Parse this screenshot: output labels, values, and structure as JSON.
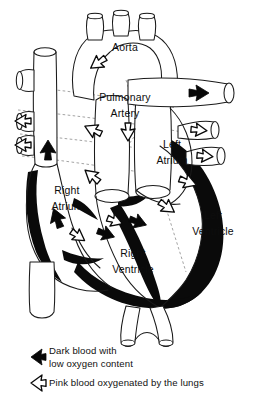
{
  "figure": {
    "width": 254,
    "height": 404
  },
  "labels": {
    "aorta": "Aorta",
    "pulmonary_artery_line1": "Pulmonary",
    "pulmonary_artery_line2": "Artery",
    "left_atrium_line1": "Left",
    "left_atrium_line2": "Atrium",
    "right_atrium_line1": "Right",
    "right_atrium_line2": "Atrium",
    "left_ventricle_line1": "Left",
    "left_ventricle_line2": "Ventricle",
    "right_ventricle_line1": "Right",
    "right_ventricle_line2": "Ventricle"
  },
  "legend": {
    "dark": {
      "line1": "Dark blood with",
      "line2": "low oxygen content",
      "marker": "dark-arrow-icon",
      "color": "#080808"
    },
    "light": {
      "line1": "Pink blood oxygenated by the lungs",
      "marker": "light-arrow-icon",
      "color": "#ffffff"
    }
  },
  "colors": {
    "ink": "#1a1a1a",
    "dark_blood": "#080808",
    "light_blood": "#ffffff",
    "dashed_guide": "#8c8c8c",
    "background": "#ffffff"
  },
  "flow_arrows": [
    {
      "name": "aorta-ascending-arrow",
      "type": "light",
      "x": 98,
      "y": 63,
      "rotation": -35
    },
    {
      "name": "superior-vena-cava-arrow",
      "type": "dark",
      "x": 48,
      "y": 150,
      "rotation": 90
    },
    {
      "name": "pulmonary-vein-left-upper-arrow",
      "type": "light",
      "x": 22,
      "y": 121,
      "rotation": 0
    },
    {
      "name": "pulmonary-vein-left-lower-arrow",
      "type": "light",
      "x": 22,
      "y": 144,
      "rotation": 0
    },
    {
      "name": "pulmonary-artery-outflow-arrow",
      "type": "dark",
      "x": 198,
      "y": 95,
      "rotation": 0
    },
    {
      "name": "pulmonary-vein-right-upper-arrow",
      "type": "light",
      "x": 215,
      "y": 133,
      "rotation": 200
    },
    {
      "name": "pulmonary-vein-right-lower-arrow",
      "type": "light",
      "x": 222,
      "y": 160,
      "rotation": 195
    },
    {
      "name": "pulmonary-trunk-arrow",
      "type": "light",
      "x": 128,
      "y": 132,
      "rotation": -90
    },
    {
      "name": "right-atrium-inflow-arrow",
      "type": "light",
      "x": 93,
      "y": 130,
      "rotation": 25
    },
    {
      "name": "tricuspid-valve-arrow",
      "type": "light",
      "x": 93,
      "y": 175,
      "rotation": 40
    },
    {
      "name": "right-atrium-lower-arrow",
      "type": "dark",
      "x": 57,
      "y": 218,
      "rotation": 70
    },
    {
      "name": "mitral-valve-arrow",
      "type": "light",
      "x": 188,
      "y": 182,
      "rotation": 200
    },
    {
      "name": "left-ventricle-inflow-arrow",
      "type": "light",
      "x": 167,
      "y": 207,
      "rotation": 215
    },
    {
      "name": "left-ventricle-outflow-arrow",
      "type": "dark",
      "x": 136,
      "y": 226,
      "rotation": 195
    },
    {
      "name": "right-ventricle-outflow-arrow",
      "type": "dark",
      "x": 103,
      "y": 238,
      "rotation": 200
    },
    {
      "name": "right-ventricle-apex-arrow",
      "type": "light",
      "x": 78,
      "y": 236,
      "rotation": 215
    },
    {
      "name": "ventricle-septum-arrow",
      "type": "light",
      "x": 113,
      "y": 223,
      "rotation": 200
    }
  ]
}
